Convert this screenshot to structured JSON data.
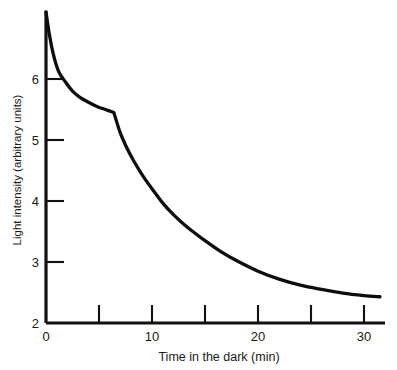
{
  "chart_data": {
    "type": "line",
    "title": "",
    "xlabel": "Time in the dark (min)",
    "ylabel": "Light intensity (arbitrary units)",
    "xlim": [
      0,
      33
    ],
    "ylim": [
      2,
      7.2
    ],
    "grid": false,
    "legend": "none",
    "x_ticks_major": [
      0,
      10,
      20,
      30
    ],
    "x_ticks_minor": [
      5,
      15,
      25
    ],
    "x_tick_labels": [
      "0",
      "10",
      "20",
      "30"
    ],
    "y_ticks": [
      2,
      3,
      4,
      5,
      6
    ],
    "y_tick_labels": [
      "2",
      "3",
      "4",
      "5",
      "6"
    ],
    "series": [
      {
        "name": "dark adaptation threshold",
        "x": [
          0,
          0.3,
          0.7,
          1.2,
          1.8,
          2.5,
          3.2,
          4.0,
          4.8,
          5.6,
          6.4,
          7.0,
          7.6,
          8.2,
          9.0,
          10.0,
          11.0,
          12.0,
          13.0,
          14.0,
          15.0,
          16.5,
          18.0,
          20.0,
          22.0,
          24.0,
          26.0,
          28.0,
          30.0,
          31.5
        ],
        "y": [
          7.1,
          6.75,
          6.4,
          6.12,
          5.96,
          5.8,
          5.7,
          5.62,
          5.55,
          5.5,
          5.45,
          5.12,
          4.88,
          4.68,
          4.45,
          4.2,
          3.97,
          3.78,
          3.62,
          3.48,
          3.35,
          3.17,
          3.02,
          2.85,
          2.72,
          2.62,
          2.55,
          2.49,
          2.45,
          2.43
        ]
      }
    ],
    "annotations": {
      "kink_point": {
        "x": 6.4,
        "y": 5.45,
        "note": "rod-cone break"
      }
    },
    "colors": {
      "curve": "#0d0d0d",
      "axis": "#111111",
      "background": "#ffffff",
      "text": "#1a1a1a"
    }
  }
}
